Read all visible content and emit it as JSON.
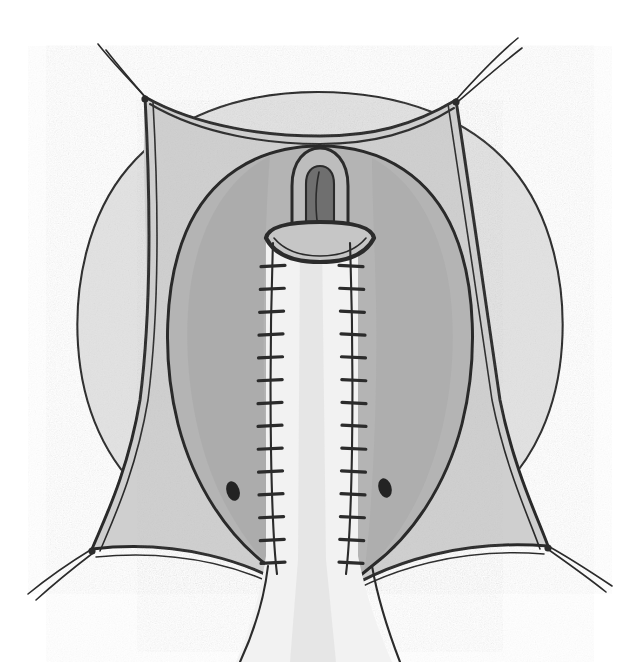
{
  "figure": {
    "kind": "medical-line-illustration",
    "title": "Surgical field illustration",
    "background_color": "#ffffff",
    "width": 641,
    "height": 662,
    "has_text_labels": false,
    "label_count": 0
  },
  "palette": {
    "ink": "#2b2b2b",
    "ink_soft": "#4a4a4a",
    "paper": "#ffffff",
    "wash_outer": "#e2e2e2",
    "wash_flap": "#cfcfcf",
    "wash_cavity": "#b4b4b4",
    "wash_cavity_deep": "#a6a6a6",
    "wash_strip": "#f2f2f2",
    "wash_stoma": "#bdbdbd",
    "wash_slit": "#6f6f6f",
    "orifice": "#232323"
  },
  "parts": {
    "outer_tissue": {
      "name": "outer tissue oval",
      "tone": "#e2e2e2"
    },
    "drape_flap": {
      "name": "retracted flap quadrilateral",
      "tone": "#cfcfcf",
      "corner_count": 4
    },
    "cavity": {
      "name": "opened cavity",
      "tone": "#b4b4b4"
    },
    "center_strip": {
      "name": "central repaired strip",
      "tone": "#f2f2f2"
    },
    "stoma": {
      "name": "everted tube stoma",
      "tone": "#bdbdbd",
      "slit_tone": "#6f6f6f"
    }
  },
  "traction_sutures": [
    {
      "id": "top-left",
      "corner_x": 145,
      "corner_y": 97,
      "strands": 2,
      "direction": "up-left"
    },
    {
      "id": "top-right",
      "corner_x": 456,
      "corner_y": 100,
      "strands": 2,
      "direction": "up-right"
    },
    {
      "id": "bottom-left",
      "corner_x": 92,
      "corner_y": 549,
      "strands": 2,
      "direction": "down-left"
    },
    {
      "id": "bottom-right",
      "corner_x": 548,
      "corner_y": 546,
      "strands": 2,
      "direction": "down-right"
    }
  ],
  "suture_lines": [
    {
      "id": "left-suture-line",
      "x": 273,
      "y_top": 243,
      "y_bottom": 572,
      "stitch_count": 14,
      "side": "left"
    },
    {
      "id": "right-suture-line",
      "x": 351,
      "y_top": 243,
      "y_bottom": 572,
      "stitch_count": 14,
      "side": "right"
    }
  ],
  "orifices": [
    {
      "id": "left-orifice",
      "cx": 233,
      "cy": 491,
      "rx": 6.5,
      "ry": 10,
      "rotation": -18
    },
    {
      "id": "right-orifice",
      "cx": 385,
      "cy": 488,
      "rx": 6.5,
      "ry": 10,
      "rotation": -16
    }
  ],
  "chart_data": null
}
